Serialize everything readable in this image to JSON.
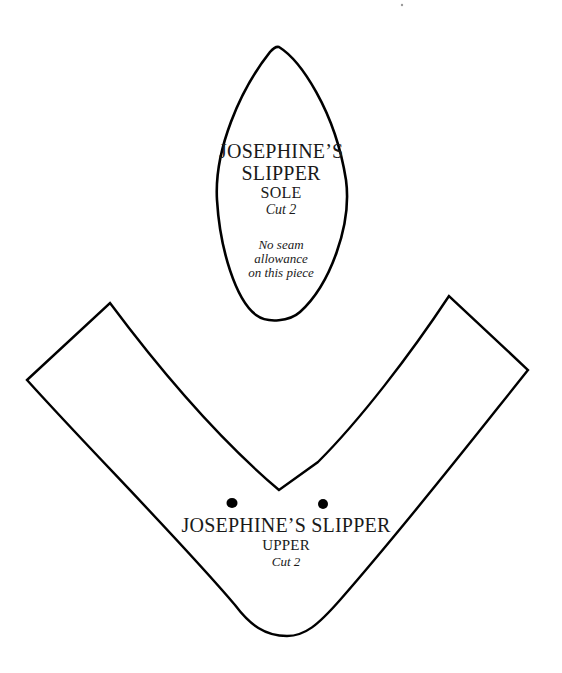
{
  "document": {
    "type": "sewing-pattern",
    "ink_color": "#000000",
    "paper_color": "#ffffff"
  },
  "pieces": {
    "sole": {
      "title_line1": "JOSEPHINE’S",
      "title_line2": "SLIPPER",
      "part": "SOLE",
      "cut": "Cut 2",
      "note_line1": "No seam",
      "note_line2": "allowance",
      "note_line3": "on this piece"
    },
    "upper": {
      "title": "JOSEPHINE’S SLIPPER",
      "part": "UPPER",
      "cut": "Cut 2",
      "markers": [
        {
          "name": "placement-dot-left",
          "x": 232,
          "y": 503
        },
        {
          "name": "placement-dot-right",
          "x": 323,
          "y": 504
        }
      ]
    }
  }
}
